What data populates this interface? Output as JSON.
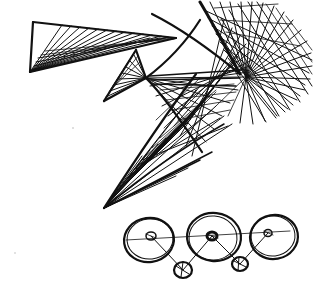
{
  "document": {
    "kind": "hand-drawn ink sketch",
    "title": "Line-envelope figure with three-wheel linkage",
    "width": 313,
    "height": 287,
    "background_color": "#ffffff",
    "ink_color": "#111111",
    "medium": "pen on paper (scanned, grayscale)"
  },
  "figures": [
    {
      "id": "upper-figure",
      "name": "line-envelope ruled figure",
      "description": "Cluster of straight-line fans whose envelopes form curved-looking triangular lobes",
      "parts": [
        {
          "id": "fan-upper-left",
          "name": "upper-left triangular fan",
          "apex": [
            30,
            72
          ],
          "top_left": [
            33,
            22
          ],
          "tip": [
            176,
            38
          ],
          "ray_count": 14
        },
        {
          "id": "fan-middle",
          "name": "middle small triangular fan",
          "apex_top": [
            136,
            50
          ],
          "apex_bottom": [
            104,
            101
          ],
          "node": [
            146,
            78
          ],
          "ray_count": 12
        },
        {
          "id": "fan-right-dense",
          "name": "right dense radial fan",
          "node": [
            246,
            77
          ],
          "spread_from": [
            196,
            2
          ],
          "spread_to": [
            312,
            120
          ],
          "ray_count": 26
        },
        {
          "id": "fan-lower-left",
          "name": "lower-left sweeping fan",
          "node": [
            104,
            208
          ],
          "ray_count": 22
        },
        {
          "id": "crosshatch-core",
          "name": "central crosshatch lattice",
          "ray_count": 34
        }
      ]
    },
    {
      "id": "lower-figure",
      "name": "three-wheel linkage diagram",
      "description": "Three large wheels with small hub circles joined by a horizontal connecting rod, with two small circles suspended below on links",
      "wheels": [
        {
          "id": "wheel-left",
          "name": "left wheel",
          "cx": 149,
          "cy": 240,
          "rx": 25,
          "ry": 22,
          "hub_cx": 151,
          "hub_cy": 236,
          "hub_r": 5
        },
        {
          "id": "wheel-middle",
          "name": "middle wheel",
          "cx": 214,
          "cy": 237,
          "rx": 27,
          "ry": 24,
          "hub_cx": 212,
          "hub_cy": 236,
          "hub_r": 5
        },
        {
          "id": "wheel-right",
          "name": "right wheel",
          "cx": 274,
          "cy": 237,
          "rx": 24,
          "ry": 22,
          "hub_cx": 268,
          "hub_cy": 233,
          "hub_r": 4
        }
      ],
      "pendant_circles": [
        {
          "id": "pendant-left",
          "name": "left pendant circle",
          "cx": 183,
          "cy": 270,
          "r": 9
        },
        {
          "id": "pendant-right",
          "name": "right pendant circle",
          "cx": 240,
          "cy": 264,
          "r": 8
        }
      ],
      "links": [
        {
          "id": "rod-main",
          "name": "horizontal connecting rod",
          "from": [
            151,
            236
          ],
          "to": [
            290,
            232
          ]
        },
        {
          "id": "link-left-down",
          "name": "left hub to left pendant",
          "from": [
            151,
            236
          ],
          "to": [
            183,
            270
          ]
        },
        {
          "id": "link-mid-left",
          "name": "middle hub to left pendant",
          "from": [
            212,
            236
          ],
          "to": [
            183,
            270
          ]
        },
        {
          "id": "link-mid-right",
          "name": "middle hub to right pendant",
          "from": [
            212,
            236
          ],
          "to": [
            240,
            264
          ]
        },
        {
          "id": "link-right-down",
          "name": "right hub to right pendant",
          "from": [
            268,
            233
          ],
          "to": [
            240,
            264
          ]
        }
      ]
    }
  ],
  "annotations": {
    "text_present": false,
    "labels": []
  }
}
